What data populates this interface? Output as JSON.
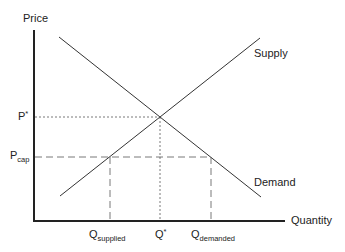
{
  "diagram": {
    "axes": {
      "y_label": "Price",
      "x_label": "Quantity"
    },
    "curves": [
      {
        "name": "Supply",
        "label": "Supply",
        "direction": "upward-sloping"
      },
      {
        "name": "Demand",
        "label": "Demand",
        "direction": "downward-sloping"
      }
    ],
    "price_levels": [
      {
        "base": "P",
        "mark": "*",
        "style": "dotted",
        "meaning": "equilibrium price"
      },
      {
        "base": "P",
        "sub": "cap",
        "style": "dashed",
        "meaning": "price ceiling"
      }
    ],
    "quantity_levels": [
      {
        "base": "Q",
        "sub": "supplied",
        "style": "dashed"
      },
      {
        "base": "Q",
        "mark": "*",
        "style": "dotted"
      },
      {
        "base": "Q",
        "sub": "demanded",
        "style": "dashed"
      }
    ],
    "colors": {
      "line": "#333333",
      "axis": "#222222",
      "background": "#ffffff"
    }
  }
}
